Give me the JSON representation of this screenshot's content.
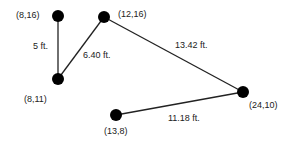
{
  "diagram": {
    "points": [
      {
        "id": "p1",
        "label": "(8,16)",
        "x": 58,
        "y": 16
      },
      {
        "id": "p2",
        "label": "(12,16)",
        "x": 104,
        "y": 17
      },
      {
        "id": "p3",
        "label": "(8,11)",
        "x": 58,
        "y": 79
      },
      {
        "id": "p4",
        "label": "(24,10)",
        "x": 243,
        "y": 92
      },
      {
        "id": "p5",
        "label": "(13,8)",
        "x": 116,
        "y": 115
      }
    ],
    "segments": [
      {
        "from": "p1",
        "to": "p3",
        "label": "5 ft."
      },
      {
        "from": "p3",
        "to": "p2",
        "label": "6.40 ft."
      },
      {
        "from": "p2",
        "to": "p4",
        "label": "13.42 ft."
      },
      {
        "from": "p5",
        "to": "p4",
        "label": "11.18 ft."
      }
    ],
    "colors": {
      "line": "#222222",
      "point": "#000000",
      "text": "#222222"
    }
  }
}
